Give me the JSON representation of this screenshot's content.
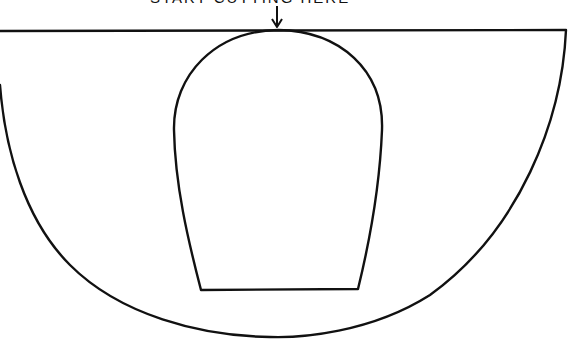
{
  "diagram": {
    "instruction_label": "START CUTTING HERE",
    "stroke_color": "#111111",
    "background_color": "#ffffff",
    "parts": [
      {
        "name": "outer-half-circle",
        "description": "Large semicircle pattern piece with flat top edge"
      },
      {
        "name": "inner-dome-cutout",
        "description": "Inner dome/arch shape with flat bottom, touching top edge"
      },
      {
        "name": "start-arrow",
        "description": "Downward arrow indicating where to start cutting"
      }
    ]
  }
}
